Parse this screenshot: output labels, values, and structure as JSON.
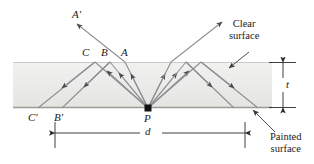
{
  "figure": {
    "colors": {
      "slab_fill": "#e9e9e7",
      "slab_fill_light": "#f1f1ef",
      "top_surface_line": "#c9c9c5",
      "bottom_surface_line": "#9a9a96",
      "ray": "#8f8f93",
      "arrowhead": "#4a4a4e",
      "leader": "#3a3a3a",
      "dimension": "#2b2b2b",
      "text": "#1a1a1a",
      "point_marker": "#111111"
    },
    "labels": {
      "a_prime": "A′",
      "a": "A",
      "b": "B",
      "c": "C",
      "b_prime": "B′",
      "c_prime": "C′",
      "p": "P",
      "thickness": "t",
      "distance": "d",
      "clear_surface": "Clear\nsurface",
      "clear_surface_line1": "Clear",
      "clear_surface_line2": "surface",
      "painted_surface_line1": "Painted",
      "painted_surface_line2": "surface"
    },
    "geometry": {
      "slab": {
        "x": 13,
        "y": 62,
        "width": 259,
        "height": 46
      },
      "point_p": {
        "x": 148,
        "y": 108
      },
      "apex_a": {
        "x": 125,
        "y": 62
      },
      "apex_b": {
        "x": 110,
        "y": 62
      },
      "apex_c": {
        "x": 95,
        "y": 62
      },
      "foot_b_prime": {
        "x": 62,
        "y": 108
      },
      "foot_c_prime": {
        "x": 38,
        "y": 108
      },
      "apex_a_right": {
        "x": 171,
        "y": 62
      },
      "apex_b_right": {
        "x": 186,
        "y": 62
      },
      "apex_c_right": {
        "x": 201,
        "y": 62
      },
      "foot_b_right": {
        "x": 234,
        "y": 108
      },
      "foot_c_right": {
        "x": 258,
        "y": 108
      },
      "escape_left_end": {
        "x": 75,
        "y": 22
      },
      "escape_right_end": {
        "x": 223,
        "y": 22
      },
      "thickness_dim_x": 277,
      "distance_dim_y": 133,
      "distance_dim_x1": 55,
      "distance_dim_x2": 245
    }
  }
}
